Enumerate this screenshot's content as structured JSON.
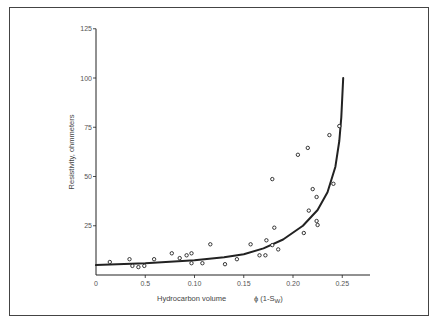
{
  "chart_data": {
    "type": "scatter",
    "title": "",
    "xlabel": "Hydrocarbon volume",
    "xlabel_formula": "ϕ (1-S",
    "xlabel_subscript": "W",
    "xlabel_close": ")",
    "ylabel": "Resistivity, ohmmeters",
    "xlim": [
      0,
      0.285
    ],
    "ylim": [
      0,
      125
    ],
    "grid": false,
    "legend": null,
    "x_ticks": [
      {
        "value": 0,
        "label": "0"
      },
      {
        "value": 0.05,
        "label": "0.5"
      },
      {
        "value": 0.1,
        "label": "0.10"
      },
      {
        "value": 0.15,
        "label": "0.15"
      },
      {
        "value": 0.2,
        "label": "0.20"
      },
      {
        "value": 0.25,
        "label": "0.25"
      }
    ],
    "y_ticks": [
      {
        "value": 25,
        "label": "25"
      },
      {
        "value": 50,
        "label": "50"
      },
      {
        "value": 75,
        "label": "75"
      },
      {
        "value": 100,
        "label": "100"
      },
      {
        "value": 125,
        "label": "125"
      }
    ],
    "series": [
      {
        "name": "Measured points",
        "marker": "open-circle",
        "points": [
          [
            0.014,
            6.6
          ],
          [
            0.034,
            8.0
          ],
          [
            0.037,
            4.6
          ],
          [
            0.043,
            4.0
          ],
          [
            0.049,
            4.6
          ],
          [
            0.059,
            8.0
          ],
          [
            0.077,
            11.0
          ],
          [
            0.085,
            8.6
          ],
          [
            0.092,
            10.0
          ],
          [
            0.097,
            11.0
          ],
          [
            0.097,
            6.0
          ],
          [
            0.108,
            6.0
          ],
          [
            0.116,
            15.6
          ],
          [
            0.131,
            5.5
          ],
          [
            0.143,
            8.0
          ],
          [
            0.157,
            15.6
          ],
          [
            0.166,
            10.0
          ],
          [
            0.172,
            10.0
          ],
          [
            0.173,
            17.6
          ],
          [
            0.179,
            48.7
          ],
          [
            0.179,
            15.2
          ],
          [
            0.181,
            24.0
          ],
          [
            0.185,
            13.0
          ],
          [
            0.205,
            61.0
          ],
          [
            0.211,
            21.3
          ],
          [
            0.215,
            64.5
          ],
          [
            0.216,
            32.7
          ],
          [
            0.22,
            43.6
          ],
          [
            0.224,
            27.4
          ],
          [
            0.224,
            39.6
          ],
          [
            0.225,
            25.4
          ],
          [
            0.237,
            71.0
          ],
          [
            0.241,
            46.3
          ],
          [
            0.247,
            75.6
          ]
        ]
      },
      {
        "name": "Fitted curve",
        "line": "solid",
        "points": [
          [
            0.0,
            5.0
          ],
          [
            0.05,
            6.0
          ],
          [
            0.1,
            7.5
          ],
          [
            0.13,
            9.0
          ],
          [
            0.15,
            10.5
          ],
          [
            0.17,
            13.5
          ],
          [
            0.19,
            18.0
          ],
          [
            0.21,
            25.0
          ],
          [
            0.225,
            33.0
          ],
          [
            0.235,
            42.0
          ],
          [
            0.243,
            55.0
          ],
          [
            0.247,
            68.0
          ],
          [
            0.249,
            80.0
          ],
          [
            0.251,
            100.0
          ]
        ]
      }
    ]
  },
  "colors": {
    "ink": "#222222",
    "frame": "#444444",
    "background": "#ffffff"
  }
}
